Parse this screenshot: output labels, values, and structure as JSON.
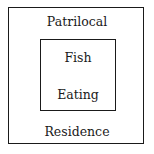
{
  "diagram": {
    "outer": {
      "top_label": "Patrilocal",
      "bottom_label": "Residence"
    },
    "inner": {
      "top_label": "Fish",
      "bottom_label": "Eating"
    },
    "colors": {
      "line": "#1a1a1a",
      "background": "#ffffff",
      "text": "#1a1a1a"
    }
  }
}
